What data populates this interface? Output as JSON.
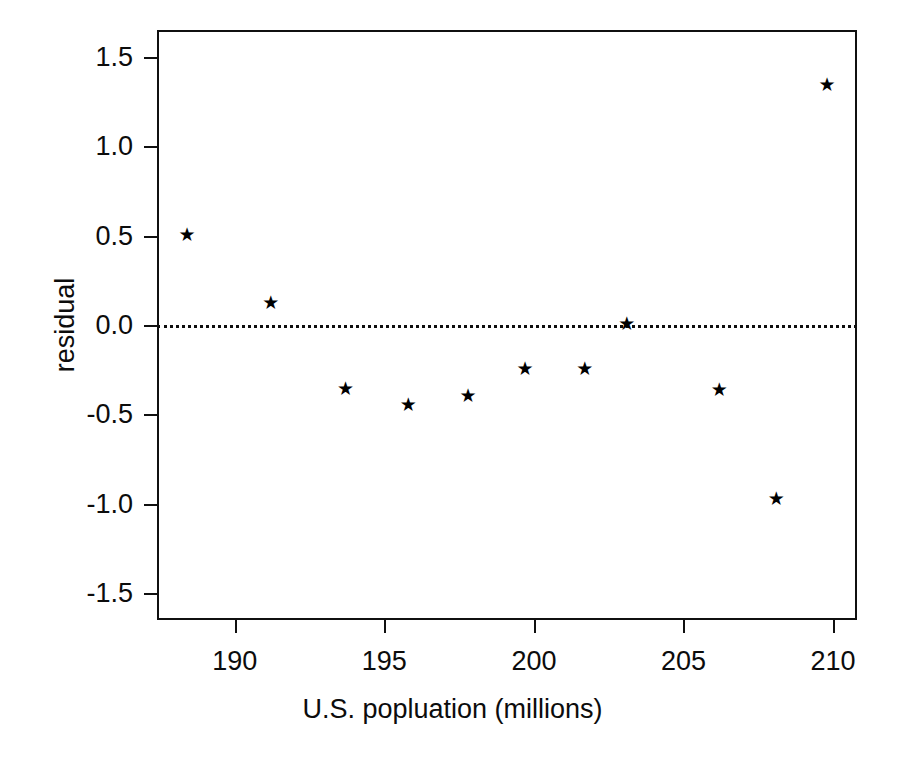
{
  "chart_data": {
    "type": "scatter",
    "title": "",
    "xlabel": "U.S. popluation (millions)",
    "ylabel": "residual",
    "xlim": [
      187.4,
      210.8
    ],
    "ylim": [
      -1.65,
      1.65
    ],
    "grid": false,
    "legend": null,
    "marker": "star",
    "marker_color": "#000000",
    "xticks": [
      190,
      195,
      200,
      205,
      210
    ],
    "xtick_labels": [
      "190",
      "195",
      "200",
      "205",
      "210"
    ],
    "yticks": [
      1.5,
      1.0,
      0.5,
      0.0,
      -0.5,
      -1.0,
      -1.5
    ],
    "ytick_labels": [
      "1.5",
      "1.0",
      "0.5",
      "0.0",
      "-0.5",
      "-1.0",
      "-1.5"
    ],
    "reference_lines": [
      {
        "name": "zero-line",
        "orientation": "horizontal",
        "y": 0.0,
        "style": "dotted",
        "color": "#0d0d0d"
      }
    ],
    "x": [
      188.4,
      191.2,
      193.7,
      195.8,
      197.8,
      199.7,
      201.7,
      203.1,
      206.2,
      208.1,
      209.8
    ],
    "y": [
      0.51,
      0.13,
      -0.35,
      -0.44,
      -0.39,
      -0.24,
      -0.24,
      0.01,
      -0.36,
      -0.97,
      1.35
    ],
    "points": [
      {
        "x": 188.4,
        "y": 0.51
      },
      {
        "x": 191.2,
        "y": 0.13
      },
      {
        "x": 193.7,
        "y": -0.35
      },
      {
        "x": 195.8,
        "y": -0.44
      },
      {
        "x": 197.8,
        "y": -0.39
      },
      {
        "x": 199.7,
        "y": -0.24
      },
      {
        "x": 201.7,
        "y": -0.24
      },
      {
        "x": 203.1,
        "y": 0.01
      },
      {
        "x": 206.2,
        "y": -0.36
      },
      {
        "x": 208.1,
        "y": -0.97
      },
      {
        "x": 209.8,
        "y": 1.35
      }
    ]
  },
  "glyphs": {
    "star": "★"
  }
}
